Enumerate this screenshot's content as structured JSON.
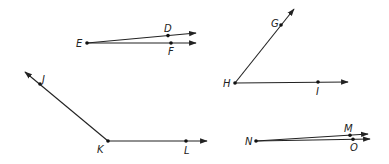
{
  "figure": {
    "angles": [
      {
        "name": "angle-DEF",
        "vertex": {
          "label": "E",
          "x": 87,
          "y": 43
        },
        "rays": [
          {
            "through": {
              "label": "D",
              "x": 168,
              "y": 36
            },
            "tip": {
              "x": 196,
              "y": 33
            }
          },
          {
            "through": {
              "label": "F",
              "x": 171,
              "y": 43
            },
            "tip": {
              "x": 196,
              "y": 43
            }
          }
        ]
      },
      {
        "name": "angle-GHI",
        "vertex": {
          "label": "H",
          "x": 235,
          "y": 83
        },
        "rays": [
          {
            "through": {
              "label": "G",
              "x": 281,
              "y": 25
            },
            "tip": {
              "x": 294,
              "y": 9
            }
          },
          {
            "through": {
              "label": "I",
              "x": 318,
              "y": 82
            },
            "tip": {
              "x": 348,
              "y": 82
            }
          }
        ]
      },
      {
        "name": "angle-JKL",
        "vertex": {
          "label": "K",
          "x": 108,
          "y": 141
        },
        "rays": [
          {
            "through": {
              "label": "J",
              "x": 40,
              "y": 84
            },
            "tip": {
              "x": 25,
              "y": 72
            }
          },
          {
            "through": {
              "label": "L",
              "x": 186,
              "y": 141
            },
            "tip": {
              "x": 207,
              "y": 141
            }
          }
        ]
      },
      {
        "name": "angle-MNO",
        "vertex": {
          "label": "N",
          "x": 256,
          "y": 141
        },
        "rays": [
          {
            "through": {
              "label": "M",
              "x": 350,
              "y": 135
            },
            "tip": {
              "x": 368,
              "y": 134
            }
          },
          {
            "through": {
              "label": "O",
              "x": 353,
              "y": 139
            },
            "tip": {
              "x": 370,
              "y": 139
            }
          }
        ]
      }
    ]
  },
  "labels": {
    "D": "D",
    "E": "E",
    "F": "F",
    "G": "G",
    "H": "H",
    "I": "I",
    "J": "J",
    "K": "K",
    "L": "L",
    "M": "M",
    "N": "N",
    "O": "O"
  },
  "colors": {
    "ink": "#222222",
    "background": "#ffffff"
  }
}
